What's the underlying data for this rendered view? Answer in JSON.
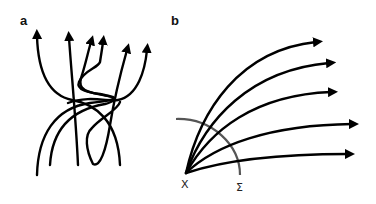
{
  "panels": {
    "a": {
      "label": "a",
      "description": "Tangled trajectories converging through a region and diverging upward",
      "arrow_count": 6
    },
    "b": {
      "label": "b",
      "description": "Trajectories fanning out from a single point crossing a surface",
      "origin_label": "X",
      "surface_label": "Σ",
      "arrow_count": 5
    }
  },
  "colors": {
    "stroke": "#000000",
    "surface": "#555555",
    "background": "#ffffff"
  }
}
